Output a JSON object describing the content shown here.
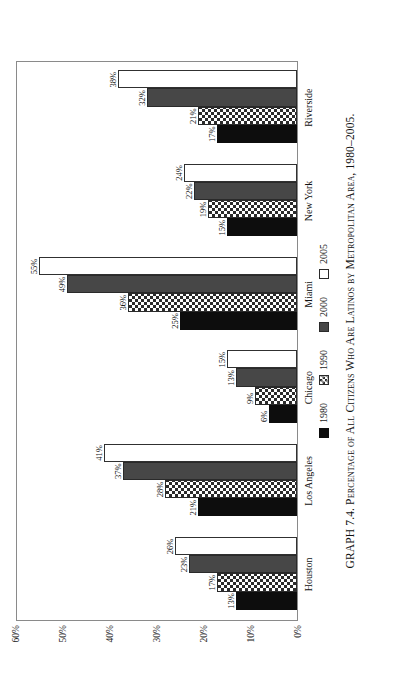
{
  "figure": {
    "caption": "GRAPH 7.4. Percentage of All Citizens Who Are Latinos by Metropolitan Area, 1980–2005."
  },
  "legend": {
    "items": [
      {
        "label": "1980",
        "swatch": "black-solid-swatch",
        "color": "#0d0d0d"
      },
      {
        "label": "1990",
        "swatch": "checkered-swatch",
        "color": "#2b2b2b"
      },
      {
        "label": "2000",
        "swatch": "dark-gray-swatch",
        "color": "#474747"
      },
      {
        "label": "2005",
        "swatch": "white-outline-swatch",
        "color": "#ffffff"
      }
    ]
  },
  "chart_data": {
    "type": "bar",
    "title": "Percentage of All Citizens Who Are Latinos by Metropolitan Area, 1980–2005",
    "xlabel": "",
    "ylabel": "",
    "grid": false,
    "legend_position": "bottom",
    "orientation": "vertical-bars-rotated-90",
    "categories": [
      "Houston",
      "Los Angeles",
      "Chicago",
      "Miami",
      "New York",
      "Riverside"
    ],
    "ylim": [
      0,
      60
    ],
    "ytick_labels": [
      "0%",
      "10%",
      "20%",
      "30%",
      "40%",
      "50%",
      "60%"
    ],
    "ytick_values": [
      0,
      10,
      20,
      30,
      40,
      50,
      60
    ],
    "series": [
      {
        "name": "1980",
        "values": [
          13,
          21,
          6,
          25,
          15,
          17
        ],
        "labels": [
          "13%",
          "21%",
          "6%",
          "25%",
          "15%",
          "17%"
        ]
      },
      {
        "name": "1990",
        "values": [
          17,
          28,
          9,
          36,
          19,
          21
        ],
        "labels": [
          "17%",
          "28%",
          "9%",
          "36%",
          "19%",
          "21%"
        ]
      },
      {
        "name": "2000",
        "values": [
          23,
          37,
          13,
          49,
          22,
          32
        ],
        "labels": [
          "23%",
          "37%",
          "13%",
          "49%",
          "22%",
          "32%"
        ]
      },
      {
        "name": "2005",
        "values": [
          26,
          41,
          15,
          55,
          24,
          38
        ],
        "labels": [
          "26%",
          "41%",
          "15%",
          "55%",
          "24%",
          "38%"
        ]
      }
    ]
  }
}
